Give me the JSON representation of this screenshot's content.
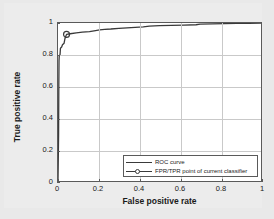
{
  "chart_data": {
    "type": "line",
    "title": "",
    "xlabel": "False positive rate",
    "ylabel": "True positive rate",
    "xlim": [
      0,
      1
    ],
    "ylim": [
      0,
      1
    ],
    "xticks": [
      "0",
      "0.2",
      "0.4",
      "0.6",
      "0.8",
      "1"
    ],
    "xtick_values": [
      0,
      0.2,
      0.4,
      0.6,
      0.8,
      1
    ],
    "yticks": [
      "0",
      "0.2",
      "0.4",
      "0.6",
      "0.8",
      "1"
    ],
    "ytick_values": [
      0,
      0.2,
      0.4,
      0.6,
      0.8,
      1
    ],
    "grid": true,
    "legend_position": "lower right",
    "series": [
      {
        "name": "ROC curve",
        "color": "#3a3a3a",
        "points": [
          [
            0.0,
            0.0
          ],
          [
            0.003,
            0.3
          ],
          [
            0.004,
            0.6
          ],
          [
            0.005,
            0.76
          ],
          [
            0.006,
            0.79
          ],
          [
            0.01,
            0.8
          ],
          [
            0.012,
            0.84
          ],
          [
            0.018,
            0.848
          ],
          [
            0.022,
            0.862
          ],
          [
            0.03,
            0.872
          ],
          [
            0.034,
            0.9
          ],
          [
            0.042,
            0.928
          ],
          [
            0.06,
            0.932
          ],
          [
            0.09,
            0.938
          ],
          [
            0.12,
            0.942
          ],
          [
            0.155,
            0.946
          ],
          [
            0.185,
            0.952
          ],
          [
            0.205,
            0.956
          ],
          [
            0.23,
            0.96
          ],
          [
            0.26,
            0.962
          ],
          [
            0.3,
            0.966
          ],
          [
            0.34,
            0.969
          ],
          [
            0.38,
            0.972
          ],
          [
            0.42,
            0.975
          ],
          [
            0.45,
            0.98
          ],
          [
            0.5,
            0.983
          ],
          [
            0.56,
            0.985
          ],
          [
            0.62,
            0.987
          ],
          [
            0.68,
            0.989
          ],
          [
            0.7,
            0.993
          ],
          [
            0.76,
            0.994
          ],
          [
            0.82,
            0.996
          ],
          [
            0.88,
            0.997
          ],
          [
            0.94,
            0.998
          ],
          [
            1.0,
            1.0
          ]
        ]
      }
    ],
    "markers": [
      {
        "name": "FPR/TPR point of current classifier",
        "x": 0.042,
        "y": 0.928,
        "color": "#3a3a3a"
      }
    ],
    "legend": [
      {
        "label": "ROC curve",
        "style": "line"
      },
      {
        "label": "FPR/TPR point of current classifier",
        "style": "line-marker"
      }
    ]
  },
  "colors": {
    "figure_background": "#e9e9e9",
    "axes_background": "#ffffff",
    "grid": "#c9c9c9",
    "axis": "#5a5a5a",
    "curve": "#3a3a3a"
  }
}
